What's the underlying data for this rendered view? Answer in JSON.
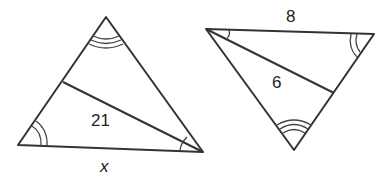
{
  "diagram": {
    "type": "similar-triangles",
    "left_triangle": {
      "segment_label": "21",
      "base_label": "x",
      "angle_marks": {
        "top": "triple-arc",
        "bottom_left": "double-arc",
        "bottom_right": "single-arc"
      }
    },
    "right_triangle": {
      "top_side_label": "8",
      "segment_label": "6",
      "angle_marks": {
        "bottom": "triple-arc",
        "top_right": "double-arc",
        "top_left": "single-arc"
      }
    },
    "colors": {
      "stroke": "#333333",
      "background": "#ffffff"
    }
  }
}
